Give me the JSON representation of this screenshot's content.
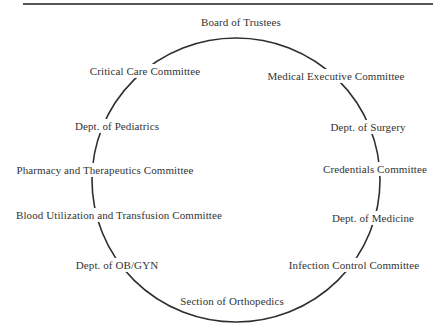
{
  "diagram": {
    "type": "circular-organization-diagram",
    "colors": {
      "line": "#2e2e2e",
      "text": "#333333",
      "background": "#ffffff",
      "divider": "#565656"
    },
    "nodes": [
      {
        "label": "Board of Trustees",
        "position": "top"
      },
      {
        "label": "Medical Executive Committee",
        "position": "upper-right"
      },
      {
        "label": "Dept. of Surgery",
        "position": "right-upper"
      },
      {
        "label": "Credentials Committee",
        "position": "right"
      },
      {
        "label": "Dept. of Medicine",
        "position": "right-lower"
      },
      {
        "label": "Infection Control Committee",
        "position": "lower-right"
      },
      {
        "label": "Section of Orthopedics",
        "position": "bottom"
      },
      {
        "label": "Dept. of OB/GYN",
        "position": "lower-left"
      },
      {
        "label": "Blood Utilization and Transfusion Committee",
        "position": "left-lower"
      },
      {
        "label": "Pharmacy and Therapeutics Committee",
        "position": "left"
      },
      {
        "label": "Dept. of Pediatrics",
        "position": "left-upper"
      },
      {
        "label": "Critical Care Committee",
        "position": "upper-left"
      }
    ]
  }
}
